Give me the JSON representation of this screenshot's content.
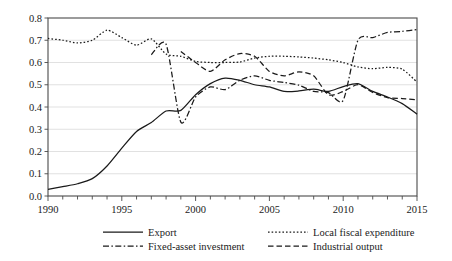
{
  "chart_data": {
    "type": "line",
    "title": "",
    "subtitle": "",
    "xlabel": "",
    "ylabel": "",
    "xlim": [
      1990,
      2015
    ],
    "ylim": [
      0.0,
      0.8
    ],
    "grid": true,
    "grid_axis": "y",
    "legend_position": "bottom",
    "legend_columns": 2,
    "y_ticks": [
      "0.0",
      "0.1",
      "0.2",
      "0.3",
      "0.4",
      "0.5",
      "0.6",
      "0.7",
      "0.8"
    ],
    "y_tick_values": [
      0.0,
      0.1,
      0.2,
      0.3,
      0.4,
      0.5,
      0.6,
      0.7,
      0.8
    ],
    "x_ticks": [
      "1990",
      "1995",
      "2000",
      "2005",
      "2010",
      "2015"
    ],
    "x_tick_values": [
      1990,
      1995,
      2000,
      2005,
      2010,
      2015
    ],
    "x_minor_tick_values": [
      1991,
      1992,
      1993,
      1994,
      1996,
      1997,
      1998,
      1999,
      2001,
      2002,
      2003,
      2004,
      2006,
      2007,
      2008,
      2009,
      2011,
      2012,
      2013,
      2014
    ],
    "series": [
      {
        "name": "Export",
        "style": "solid",
        "color": "#1a1a1a",
        "x": [
          1990,
          1991,
          1992,
          1993,
          1994,
          1995,
          1996,
          1997,
          1998,
          1999,
          2000,
          2001,
          2002,
          2003,
          2004,
          2005,
          2006,
          2007,
          2008,
          2009,
          2010,
          2011,
          2012,
          2013,
          2014,
          2015
        ],
        "values": [
          0.03,
          0.042,
          0.055,
          0.078,
          0.135,
          0.215,
          0.29,
          0.33,
          0.382,
          0.385,
          0.455,
          0.505,
          0.53,
          0.52,
          0.5,
          0.49,
          0.47,
          0.472,
          0.48,
          0.47,
          0.492,
          0.505,
          0.47,
          0.445,
          0.415,
          0.368
        ]
      },
      {
        "name": "Fixed-asset investment",
        "style": "dashdot",
        "color": "#1a1a1a",
        "x": [
          1997,
          1998,
          1999,
          2000,
          2001,
          2002,
          2003,
          2004,
          2005,
          2006,
          2007,
          2008,
          2009,
          2010,
          2011,
          2012,
          2013,
          2014,
          2015
        ],
        "values": [
          0.635,
          0.682,
          0.332,
          0.445,
          0.49,
          0.478,
          0.52,
          0.54,
          0.52,
          0.51,
          0.498,
          0.47,
          0.465,
          0.43,
          0.7,
          0.712,
          0.735,
          0.74,
          0.748
        ]
      },
      {
        "name": "Local fiscal expenditure",
        "style": "dotted",
        "color": "#1a1a1a",
        "x": [
          1990,
          1991,
          1992,
          1993,
          1994,
          1995,
          1996,
          1997,
          1998,
          1999,
          2000,
          2001,
          2002,
          2003,
          2004,
          2005,
          2006,
          2007,
          2008,
          2009,
          2010,
          2011,
          2012,
          2013,
          2014,
          2015
        ],
        "values": [
          0.708,
          0.7,
          0.688,
          0.7,
          0.745,
          0.712,
          0.678,
          0.706,
          0.638,
          0.628,
          0.605,
          0.6,
          0.6,
          0.602,
          0.62,
          0.628,
          0.628,
          0.625,
          0.62,
          0.612,
          0.6,
          0.58,
          0.572,
          0.578,
          0.57,
          0.512
        ]
      },
      {
        "name": "Industrial output",
        "style": "dashed",
        "color": "#1a1a1a",
        "x": [
          1999,
          2000,
          2001,
          2002,
          2003,
          2004,
          2005,
          2006,
          2007,
          2008,
          2009,
          2010,
          2011,
          2012,
          2013,
          2014,
          2015
        ],
        "values": [
          0.65,
          0.6,
          0.56,
          0.612,
          0.64,
          0.628,
          0.56,
          0.54,
          0.558,
          0.54,
          0.455,
          0.47,
          0.5,
          0.465,
          0.442,
          0.438,
          0.432
        ]
      }
    ]
  },
  "legend": {
    "items": [
      {
        "label": "Export",
        "style": "solid"
      },
      {
        "label": "Local fiscal expenditure",
        "style": "dotted"
      },
      {
        "label": "Fixed-asset investment",
        "style": "dashdot"
      },
      {
        "label": "Industrial output",
        "style": "dashed"
      }
    ]
  }
}
